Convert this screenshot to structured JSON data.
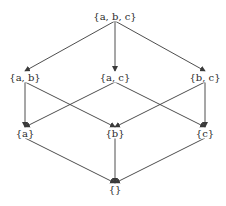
{
  "diagram": {
    "type": "hasse-diagram",
    "stroke_color": "#3a3a3a",
    "text_color": "#2a2a2a",
    "background": "#ffffff",
    "nodes": [
      {
        "id": "abc",
        "label": "{a, b, c}",
        "x": 115,
        "y": 16
      },
      {
        "id": "ab",
        "label": "{a, b}",
        "x": 25,
        "y": 77
      },
      {
        "id": "ac",
        "label": "{a, c}",
        "x": 115,
        "y": 77
      },
      {
        "id": "bc",
        "label": "{b, c}",
        "x": 205,
        "y": 77
      },
      {
        "id": "a",
        "label": "{a}",
        "x": 25,
        "y": 133
      },
      {
        "id": "b",
        "label": "{b}",
        "x": 115,
        "y": 133
      },
      {
        "id": "c",
        "label": "{c}",
        "x": 205,
        "y": 133
      },
      {
        "id": "empty",
        "label": "{}",
        "x": 115,
        "y": 189
      }
    ],
    "edges": [
      {
        "from": "abc",
        "to": "ab"
      },
      {
        "from": "abc",
        "to": "ac"
      },
      {
        "from": "abc",
        "to": "bc"
      },
      {
        "from": "ab",
        "to": "a"
      },
      {
        "from": "ab",
        "to": "b"
      },
      {
        "from": "ac",
        "to": "a"
      },
      {
        "from": "ac",
        "to": "c"
      },
      {
        "from": "bc",
        "to": "b"
      },
      {
        "from": "bc",
        "to": "c"
      },
      {
        "from": "a",
        "to": "empty"
      },
      {
        "from": "b",
        "to": "empty"
      },
      {
        "from": "c",
        "to": "empty"
      }
    ]
  }
}
